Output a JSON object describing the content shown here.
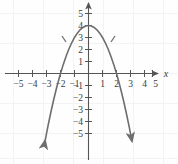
{
  "figure": {
    "title": "",
    "x_axis_label": "x",
    "y_axis_label": ""
  },
  "axes": {
    "x_ticks": [
      -5,
      -4,
      -3,
      -2,
      -1,
      1,
      2,
      3,
      4,
      5
    ],
    "y_ticks": [
      5,
      4,
      3,
      2,
      1,
      -1,
      -2,
      -3,
      -4,
      -5
    ],
    "x_tick_labels": [
      "−5",
      "−4",
      "−3",
      "−2",
      "−1",
      "1",
      "2",
      "3",
      "4",
      "5"
    ],
    "y_tick_labels": [
      "5",
      "4",
      "3",
      "2",
      "1",
      "−1",
      "−2",
      "−3",
      "−4",
      "−5"
    ],
    "xlim": [
      -5.9,
      5.9
    ],
    "ylim": [
      -5.9,
      5.6
    ],
    "grid": true,
    "axis_color": "#555555",
    "grid_color": "#f2f2f2"
  },
  "chart_data": {
    "type": "line",
    "title": "",
    "xlabel": "x",
    "ylabel": "",
    "xlim": [
      -5.9,
      5.9
    ],
    "ylim": [
      -5.9,
      5.6
    ],
    "grid": true,
    "legend": "none",
    "series": [
      {
        "name": "y = -x^2 + 4",
        "equation": "y = -x² + 4",
        "color": "#6e6e6e",
        "vertex": [
          0,
          4
        ],
        "x_intercepts": [
          -2,
          2
        ],
        "y_intercept": 4,
        "opens": "down",
        "arrow_ends": true,
        "x": [
          -3.1,
          -2.9,
          -2.7,
          -2.5,
          -2.3,
          -2.1,
          -2.0,
          -1.8,
          -1.6,
          -1.4,
          -1.2,
          -1.0,
          -0.8,
          -0.6,
          -0.4,
          -0.2,
          0.0,
          0.2,
          0.4,
          0.6,
          0.8,
          1.0,
          1.2,
          1.4,
          1.6,
          1.8,
          2.0,
          2.1,
          2.3,
          2.5,
          2.7,
          2.9,
          3.1
        ],
        "y": [
          -5.61,
          -4.41,
          -3.29,
          -2.25,
          -1.29,
          -0.41,
          0.0,
          0.76,
          1.44,
          2.04,
          2.56,
          3.0,
          3.36,
          3.64,
          3.84,
          3.96,
          4.0,
          3.96,
          3.84,
          3.64,
          3.36,
          3.0,
          2.56,
          2.04,
          1.44,
          0.76,
          0.0,
          -0.41,
          -1.29,
          -2.25,
          -3.29,
          -4.41,
          -5.61
        ]
      }
    ]
  }
}
